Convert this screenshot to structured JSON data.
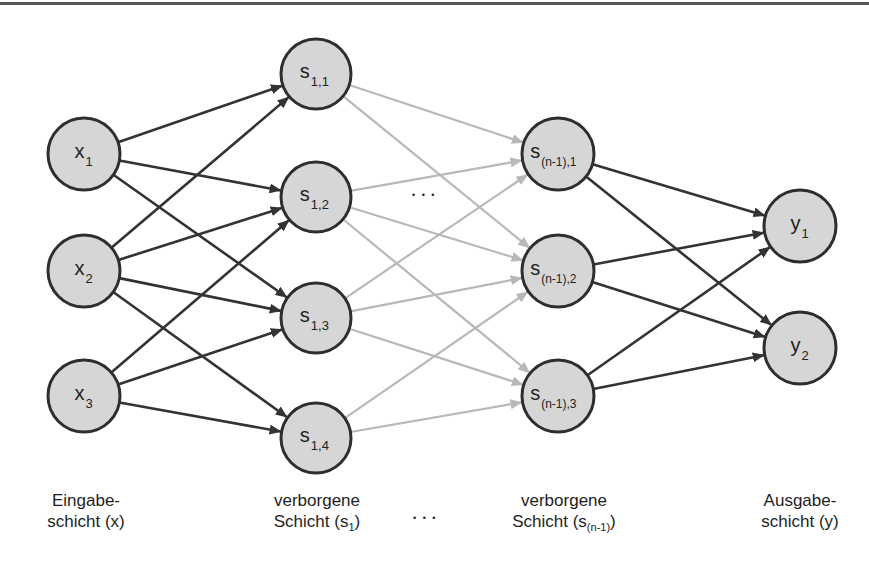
{
  "colors": {
    "background": "#ffffff",
    "node_fill": "#d6d6d6",
    "node_stroke": "#2e2e2e",
    "edge_dark": "#333333",
    "edge_light": "#b8b8b8",
    "text": "#1e1e1e",
    "top_rule": "#555555"
  },
  "nodes": [
    {
      "id": "x1",
      "base": "x",
      "sub": "1",
      "cx": 84,
      "cy": 154,
      "r": 36,
      "layer": "input"
    },
    {
      "id": "x2",
      "base": "x",
      "sub": "2",
      "cx": 84,
      "cy": 271,
      "r": 36,
      "layer": "input"
    },
    {
      "id": "x3",
      "base": "x",
      "sub": "3",
      "cx": 84,
      "cy": 396,
      "r": 36,
      "layer": "input"
    },
    {
      "id": "s11",
      "base": "s",
      "sub": "1,1",
      "cx": 316,
      "cy": 74,
      "r": 35,
      "layer": "hidden1"
    },
    {
      "id": "s12",
      "base": "s",
      "sub": "1,2",
      "cx": 316,
      "cy": 197,
      "r": 35,
      "layer": "hidden1"
    },
    {
      "id": "s13",
      "base": "s",
      "sub": "1,3",
      "cx": 316,
      "cy": 318,
      "r": 35,
      "layer": "hidden1"
    },
    {
      "id": "s14",
      "base": "s",
      "sub": "1,4",
      "cx": 316,
      "cy": 438,
      "r": 35,
      "layer": "hidden1"
    },
    {
      "id": "sn1",
      "base": "s",
      "sub": "(n-1),1",
      "cx": 558,
      "cy": 154,
      "r": 36,
      "layer": "hiddenN"
    },
    {
      "id": "sn2",
      "base": "s",
      "sub": "(n-1),2",
      "cx": 558,
      "cy": 271,
      "r": 36,
      "layer": "hiddenN"
    },
    {
      "id": "sn3",
      "base": "s",
      "sub": "(n-1),3",
      "cx": 558,
      "cy": 396,
      "r": 36,
      "layer": "hiddenN"
    },
    {
      "id": "y1",
      "base": "y",
      "sub": "1",
      "cx": 800,
      "cy": 226,
      "r": 36,
      "layer": "output"
    },
    {
      "id": "y2",
      "base": "y",
      "sub": "2",
      "cx": 800,
      "cy": 348,
      "r": 36,
      "layer": "output"
    }
  ],
  "edges": [
    {
      "from": "x1",
      "to": "s11",
      "style": "dark"
    },
    {
      "from": "x1",
      "to": "s12",
      "style": "dark"
    },
    {
      "from": "x1",
      "to": "s13",
      "style": "dark"
    },
    {
      "from": "x2",
      "to": "s11",
      "style": "dark"
    },
    {
      "from": "x2",
      "to": "s12",
      "style": "dark"
    },
    {
      "from": "x2",
      "to": "s13",
      "style": "dark"
    },
    {
      "from": "x2",
      "to": "s14",
      "style": "dark"
    },
    {
      "from": "x3",
      "to": "s12",
      "style": "dark"
    },
    {
      "from": "x3",
      "to": "s13",
      "style": "dark"
    },
    {
      "from": "x3",
      "to": "s14",
      "style": "dark"
    },
    {
      "from": "s11",
      "to": "sn1",
      "style": "light"
    },
    {
      "from": "s11",
      "to": "sn2",
      "style": "light"
    },
    {
      "from": "s12",
      "to": "sn1",
      "style": "light"
    },
    {
      "from": "s12",
      "to": "sn2",
      "style": "light"
    },
    {
      "from": "s12",
      "to": "sn3",
      "style": "light"
    },
    {
      "from": "s13",
      "to": "sn1",
      "style": "light"
    },
    {
      "from": "s13",
      "to": "sn2",
      "style": "light"
    },
    {
      "from": "s13",
      "to": "sn3",
      "style": "light"
    },
    {
      "from": "s14",
      "to": "sn2",
      "style": "light"
    },
    {
      "from": "s14",
      "to": "sn3",
      "style": "light"
    },
    {
      "from": "sn1",
      "to": "y1",
      "style": "dark"
    },
    {
      "from": "sn1",
      "to": "y2",
      "style": "dark"
    },
    {
      "from": "sn2",
      "to": "y1",
      "style": "dark"
    },
    {
      "from": "sn2",
      "to": "y2",
      "style": "dark"
    },
    {
      "from": "sn3",
      "to": "y1",
      "style": "dark"
    },
    {
      "from": "sn3",
      "to": "y2",
      "style": "dark"
    }
  ],
  "ellipses": {
    "middle": "• • •",
    "bottom": "• • •"
  },
  "layer_labels": {
    "input": {
      "line1": "Eingabe-",
      "line2_pre": "schicht (x)",
      "line2_sub": "",
      "line2_post": ""
    },
    "hidden1": {
      "line1": "verborgene",
      "line2_pre": "Schicht (s",
      "line2_sub": "1",
      "line2_post": ")"
    },
    "hiddenN": {
      "line1": "verborgene",
      "line2_pre": "Schicht (s",
      "line2_sub": "(n-1)",
      "line2_post": ")"
    },
    "output": {
      "line1": "Ausgabe-",
      "line2_pre": "schicht (y)",
      "line2_sub": "",
      "line2_post": ""
    }
  }
}
